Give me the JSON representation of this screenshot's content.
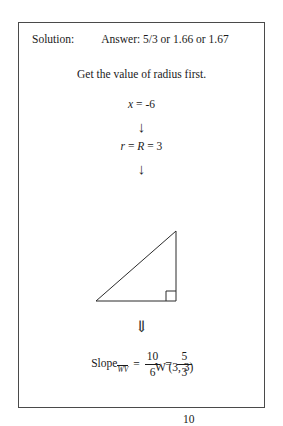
{
  "card": {
    "header": {
      "solution_label": "Solution:",
      "answer_text": "Answer: 5/3 or 1.66 or 1.67"
    },
    "step_instruction": "Get the value of radius first.",
    "equations": {
      "x_value": {
        "lhs": "x",
        "rest": " = -6"
      },
      "radius": {
        "lhs": "r",
        "mid": " = ",
        "rhs": "R",
        "tail": " = 3"
      }
    },
    "arrows": {
      "first": "↓",
      "second": "↓",
      "third": "⇓"
    },
    "figure": {
      "vertex_w_label": "W (3, 3)",
      "vertex_v_label": "V (-3, -7)",
      "leg_vertical_label": "10",
      "leg_base_label": "6",
      "right_angle_marker": "right-angle-square"
    },
    "slope": {
      "word": "Slope",
      "subscript": "WV",
      "equals_1": "=",
      "fraction_1": {
        "numerator": "10",
        "denominator": "6"
      },
      "equals_2": "=",
      "fraction_2": {
        "numerator": "5",
        "denominator": "3"
      }
    }
  },
  "colors": {
    "border": "#4a4a4a",
    "text": "#1a1a1a",
    "background": "#ffffff",
    "figure_stroke": "#2b2b2b"
  }
}
